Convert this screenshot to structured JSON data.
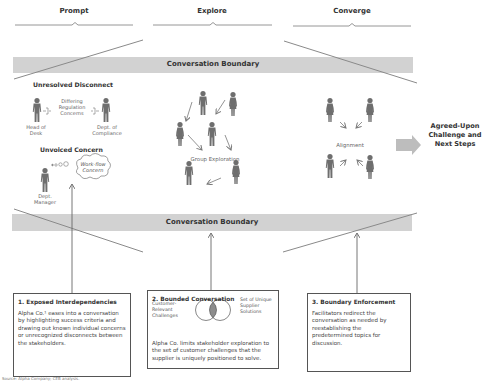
{
  "phases": [
    {
      "label": "Prompt"
    },
    {
      "label": "Explore"
    },
    {
      "label": "Converge"
    }
  ],
  "boundaries": {
    "top_label": "Conversation Boundary",
    "bottom_label": "Conversation Boundary"
  },
  "prompt_section": {
    "unresolved": {
      "title": "Unresolved Disconnect",
      "middle_label": "Differing Regulation Concerns",
      "left_person": "Head of Desk",
      "right_person": "Dept. of Compliance"
    },
    "unvoiced": {
      "title": "Unvoiced Concern",
      "thought": "Work-flow Concern",
      "person": "Dept. Manager"
    }
  },
  "explore_section": {
    "label": "Group Exploration"
  },
  "converge_section": {
    "label": "Alignment"
  },
  "outcome": {
    "label": "Agreed-Upon Challenge and Next Steps"
  },
  "boxes": [
    {
      "title": "1. Exposed Interdependencies",
      "body": "Alpha Co.¹ eases into a conversation by highlighting success criteria and drawing out known individual concerns or unrecognized disconnects between the stakeholders."
    },
    {
      "title": "2. Bounded Conversation",
      "venn_left": "Customer-Relevant Challenges",
      "venn_right": "Set of Unique Supplier Solutions",
      "body": "Alpha Co. limits stakeholder exploration to the set of customer challenges that the supplier is uniquely positioned to solve."
    },
    {
      "title": "3. Boundary Enforcement",
      "body": "Facilitators redirect the conversation as needed by reestablishing the predetermined topics for discussion."
    }
  ],
  "source": "Source: Alpha Company; CEB analysis.",
  "colors": {
    "band": "#d2d2d2",
    "line": "#8a8a8a",
    "person": "#6e6e6e",
    "venn_overlap": "#8c8c8c",
    "arrow_block": "#bdbdbd"
  }
}
